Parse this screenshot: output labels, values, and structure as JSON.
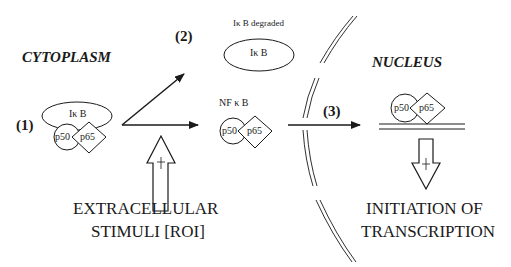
{
  "regions": {
    "cytoplasm": "CYTOPLASM",
    "nucleus": "NUCLEUS"
  },
  "steps": {
    "step1": "(1)",
    "step2": "(2)",
    "step3": "(3)"
  },
  "molecules": {
    "ikb": "Iκ B",
    "ikb_degraded_label": "Iκ B degraded",
    "ikb_degraded": "Iκ B",
    "nfkb_label": "NF κ B",
    "p50": "p50",
    "p65": "p65"
  },
  "captions": {
    "stimuli_line1": "EXTRACELLULAR",
    "stimuli_line2": "STIMULI [ROI]",
    "transcription_line1": "INITIATION OF",
    "transcription_line2": "TRANSCRIPTION"
  },
  "colors": {
    "stroke": "#1a1a1a",
    "background": "#ffffff"
  }
}
